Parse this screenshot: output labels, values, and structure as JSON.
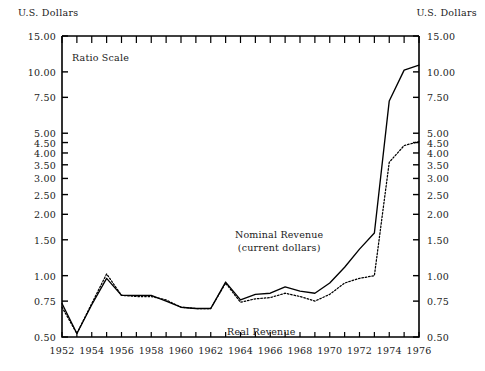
{
  "axis_titles": {
    "left": "U.S. Dollars",
    "right": "U.S. Dollars"
  },
  "annotations": {
    "ratio_scale": "Ratio Scale",
    "nominal_line1": "Nominal Revenue",
    "nominal_line2": "(current dollars)",
    "real": "Real Revenue"
  },
  "chart_data": {
    "type": "line",
    "title": "",
    "subtitle": "",
    "xlabel": "",
    "ylabel": "U.S. Dollars",
    "y2label": "U.S. Dollars",
    "scale": "log",
    "scale_note": "Ratio Scale",
    "grid": false,
    "legend": "inline-annotations",
    "xlim": [
      1952,
      1976
    ],
    "ylim": [
      0.5,
      15.0
    ],
    "xticks": [
      1952,
      1953,
      1954,
      1955,
      1956,
      1957,
      1958,
      1959,
      1960,
      1961,
      1962,
      1963,
      1964,
      1965,
      1966,
      1967,
      1968,
      1969,
      1970,
      1971,
      1972,
      1973,
      1974,
      1975,
      1976
    ],
    "xtick_labels": [
      "1952",
      "",
      "1954",
      "",
      "1956",
      "",
      "1958",
      "",
      "1960",
      "",
      "1962",
      "",
      "1964",
      "",
      "1966",
      "",
      "1968",
      "",
      "1970",
      "",
      "1972",
      "",
      "1974",
      "",
      "1976"
    ],
    "yticks": [
      0.5,
      0.75,
      1.0,
      1.5,
      2.0,
      2.5,
      3.0,
      3.5,
      4.0,
      4.5,
      5.0,
      7.5,
      10.0,
      15.0
    ],
    "ytick_labels": [
      "0.50",
      "0.75",
      "1.00",
      "1.50",
      "2.00",
      "2.50",
      "3.00",
      "3.50",
      "4.00",
      "4.50",
      "5.00",
      "7.50",
      "10.00",
      "15.00"
    ],
    "x": [
      1952,
      1953,
      1954,
      1955,
      1956,
      1957,
      1958,
      1959,
      1960,
      1961,
      1962,
      1963,
      1964,
      1965,
      1966,
      1967,
      1968,
      1969,
      1970,
      1971,
      1972,
      1973,
      1974,
      1975,
      1976
    ],
    "series": [
      {
        "name": "Nominal Revenue",
        "name_sub": "(current dollars)",
        "style": "solid",
        "color": "#000000",
        "values": [
          0.73,
          0.52,
          0.72,
          0.97,
          0.8,
          0.8,
          0.8,
          0.75,
          0.7,
          0.69,
          0.69,
          0.93,
          0.76,
          0.81,
          0.82,
          0.88,
          0.84,
          0.82,
          0.92,
          1.1,
          1.35,
          1.62,
          7.2,
          10.2,
          10.8
        ]
      },
      {
        "name": "Real Revenue",
        "style": "dotted",
        "color": "#000000",
        "values": [
          0.7,
          0.52,
          0.73,
          1.02,
          0.8,
          0.79,
          0.79,
          0.76,
          0.7,
          0.69,
          0.69,
          0.92,
          0.74,
          0.77,
          0.78,
          0.82,
          0.79,
          0.75,
          0.81,
          0.92,
          0.97,
          1.0,
          3.6,
          4.35,
          4.55
        ]
      }
    ]
  }
}
